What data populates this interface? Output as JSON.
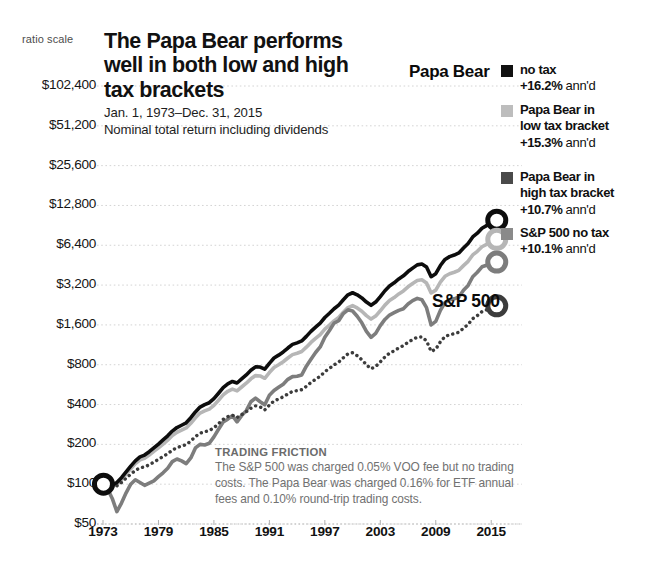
{
  "chart_data": {
    "type": "line",
    "title": "The Papa Bear performs well in both low and high tax brackets",
    "subtitle_line1": "Jan. 1, 1973–Dec. 31, 2015",
    "subtitle_line2": "Nominal total return including dividends",
    "scale_note": "ratio scale",
    "xlabel": "",
    "ylabel": "",
    "grid": true,
    "legend_position": "right",
    "y_scale": "log2",
    "ylim": [
      50,
      102400
    ],
    "xlim": [
      1973,
      2015.95
    ],
    "ytick_labels": [
      "$102,400",
      "$51,200",
      "$25,600",
      "$12,800",
      "$6,400",
      "$3,200",
      "$1,600",
      "$800",
      "$400",
      "$200",
      "$100",
      "$50"
    ],
    "ytick_values": [
      102400,
      51200,
      25600,
      12800,
      6400,
      3200,
      1600,
      800,
      400,
      200,
      100,
      50
    ],
    "xtick_labels": [
      "1973",
      "1979",
      "1985",
      "1991",
      "1997",
      "2003",
      "2009",
      "2015"
    ],
    "xtick_values": [
      1973,
      1979,
      1985,
      1991,
      1997,
      2003,
      2009,
      2015
    ],
    "inline_labels": [
      {
        "text": "Papa Bear",
        "series": "papa-bear-no-tax"
      },
      {
        "text": "S&P 500",
        "series": "sp500-no-tax"
      }
    ],
    "start_value": 100,
    "start_year": 1973,
    "series": [
      {
        "name": "no tax",
        "full_name": "Papa Bear no tax",
        "annualized": "+16.2%",
        "color": "#0d0d0d",
        "style": "solid",
        "width": 3.6,
        "end_value": 65000,
        "x": [
          1973.0,
          1973.5,
          1974.0,
          1974.5,
          1975.0,
          1975.5,
          1976.0,
          1976.5,
          1977.0,
          1977.5,
          1978.0,
          1978.5,
          1979.0,
          1979.5,
          1980.0,
          1980.5,
          1981.0,
          1981.5,
          1982.0,
          1982.5,
          1983.0,
          1983.5,
          1984.0,
          1984.5,
          1985.0,
          1985.5,
          1986.0,
          1986.5,
          1987.0,
          1987.5,
          1988.0,
          1988.5,
          1989.0,
          1989.5,
          1990.0,
          1990.5,
          1991.0,
          1991.5,
          1992.0,
          1992.5,
          1993.0,
          1993.5,
          1994.0,
          1994.5,
          1995.0,
          1995.5,
          1996.0,
          1996.5,
          1997.0,
          1997.5,
          1998.0,
          1998.5,
          1999.0,
          1999.5,
          2000.0,
          2000.5,
          2001.0,
          2001.5,
          2002.0,
          2002.5,
          2003.0,
          2003.5,
          2004.0,
          2004.5,
          2005.0,
          2005.5,
          2006.0,
          2006.5,
          2007.0,
          2007.5,
          2008.0,
          2008.5,
          2009.0,
          2009.5,
          2010.0,
          2010.5,
          2011.0,
          2011.5,
          2012.0,
          2012.5,
          2013.0,
          2013.5,
          2014.0,
          2014.5,
          2015.0,
          2015.5,
          2015.95
        ],
        "y": [
          100,
          104,
          98,
          103,
          112,
          124,
          137,
          150,
          161,
          166,
          176,
          188,
          201,
          216,
          232,
          252,
          268,
          279,
          291,
          318,
          352,
          383,
          400,
          413,
          443,
          487,
          537,
          574,
          598,
          582,
          625,
          670,
          726,
          770,
          768,
          740,
          820,
          900,
          945,
          1000,
          1070,
          1140,
          1170,
          1210,
          1310,
          1430,
          1540,
          1650,
          1820,
          1960,
          2120,
          2260,
          2480,
          2700,
          2800,
          2700,
          2560,
          2380,
          2250,
          2380,
          2620,
          2900,
          3150,
          3330,
          3560,
          3760,
          4050,
          4300,
          4550,
          4620,
          4380,
          3700,
          3900,
          4500,
          5000,
          5250,
          5400,
          5600,
          6100,
          6600,
          7400,
          7900,
          8600,
          9000,
          9600,
          9900,
          10200
        ]
      },
      {
        "name": "Papa Bear in low tax bracket",
        "full_name": "Papa Bear in low tax bracket",
        "annualized": "+15.3%",
        "color": "#b6b6b6",
        "style": "solid",
        "width": 3.6,
        "end_value": 55000,
        "x": [
          1973.0,
          1973.5,
          1974.0,
          1974.5,
          1975.0,
          1975.5,
          1976.0,
          1976.5,
          1977.0,
          1977.5,
          1978.0,
          1978.5,
          1979.0,
          1979.5,
          1980.0,
          1980.5,
          1981.0,
          1981.5,
          1982.0,
          1982.5,
          1983.0,
          1983.5,
          1984.0,
          1984.5,
          1985.0,
          1985.5,
          1986.0,
          1986.5,
          1987.0,
          1987.5,
          1988.0,
          1988.5,
          1989.0,
          1989.5,
          1990.0,
          1990.5,
          1991.0,
          1991.5,
          1992.0,
          1992.5,
          1993.0,
          1993.5,
          1994.0,
          1994.5,
          1995.0,
          1995.5,
          1996.0,
          1996.5,
          1997.0,
          1997.5,
          1998.0,
          1998.5,
          1999.0,
          1999.5,
          2000.0,
          2000.5,
          2001.0,
          2001.5,
          2002.0,
          2002.5,
          2003.0,
          2003.5,
          2004.0,
          2004.5,
          2005.0,
          2005.5,
          2006.0,
          2006.5,
          2007.0,
          2007.5,
          2008.0,
          2008.5,
          2009.0,
          2009.5,
          2010.0,
          2010.5,
          2011.0,
          2011.5,
          2012.0,
          2012.5,
          2013.0,
          2013.5,
          2014.0,
          2014.5,
          2015.0,
          2015.5,
          2015.95
        ],
        "y": [
          100,
          103,
          96,
          100,
          108,
          119,
          131,
          143,
          153,
          157,
          166,
          177,
          188,
          201,
          215,
          233,
          247,
          256,
          266,
          289,
          318,
          345,
          358,
          369,
          394,
          431,
          473,
          504,
          523,
          508,
          543,
          580,
          626,
          662,
          658,
          632,
          698,
          763,
          799,
          843,
          899,
          954,
          977,
          1008,
          1086,
          1180,
          1266,
          1352,
          1486,
          1594,
          1718,
          1824,
          1996,
          2164,
          2238,
          2150,
          2030,
          1880,
          1770,
          1866,
          2046,
          2258,
          2444,
          2576,
          2744,
          2890,
          3104,
          3286,
          3466,
          3510,
          3320,
          2790,
          2930,
          3370,
          3730,
          3900,
          4000,
          4140,
          4490,
          4840,
          5410,
          5760,
          6240,
          6500,
          6900,
          7100,
          7300
        ]
      },
      {
        "name": "Papa Bear in high tax bracket",
        "full_name": "Papa Bear in high tax bracket",
        "annualized": "+10.7%",
        "color": "#3c3c3c",
        "style": "dotted",
        "width": 3.4,
        "end_value": 9000,
        "x": [
          1973.0,
          1973.5,
          1974.0,
          1974.5,
          1975.0,
          1975.5,
          1976.0,
          1976.5,
          1977.0,
          1977.5,
          1978.0,
          1978.5,
          1979.0,
          1979.5,
          1980.0,
          1980.5,
          1981.0,
          1981.5,
          1982.0,
          1982.5,
          1983.0,
          1983.5,
          1984.0,
          1984.5,
          1985.0,
          1985.5,
          1986.0,
          1986.5,
          1987.0,
          1987.5,
          1988.0,
          1988.5,
          1989.0,
          1989.5,
          1990.0,
          1990.5,
          1991.0,
          1991.5,
          1992.0,
          1992.5,
          1993.0,
          1993.5,
          1994.0,
          1994.5,
          1995.0,
          1995.5,
          1996.0,
          1996.5,
          1997.0,
          1997.5,
          1998.0,
          1998.5,
          1999.0,
          1999.5,
          2000.0,
          2000.5,
          2001.0,
          2001.5,
          2002.0,
          2002.5,
          2003.0,
          2003.5,
          2004.0,
          2004.5,
          2005.0,
          2005.5,
          2006.0,
          2006.5,
          2007.0,
          2007.5,
          2008.0,
          2008.5,
          2009.0,
          2009.5,
          2010.0,
          2010.5,
          2011.0,
          2011.5,
          2012.0,
          2012.5,
          2013.0,
          2013.5,
          2014.0,
          2014.5,
          2015.0,
          2015.5,
          2015.95
        ],
        "y": [
          100,
          102,
          95,
          97,
          103,
          111,
          119,
          127,
          133,
          135,
          140,
          147,
          154,
          162,
          170,
          181,
          189,
          194,
          199,
          212,
          229,
          243,
          249,
          254,
          267,
          287,
          309,
          324,
          332,
          319,
          336,
          353,
          375,
          391,
          384,
          364,
          396,
          426,
          440,
          458,
          481,
          503,
          509,
          518,
          549,
          588,
          621,
          654,
          709,
          750,
          798,
          837,
          903,
          967,
          986,
          936,
          873,
          800,
          745,
          776,
          840,
          916,
          978,
          1019,
          1072,
          1115,
          1183,
          1238,
          1292,
          1296,
          1212,
          1008,
          1048,
          1192,
          1305,
          1350,
          1372,
          1407,
          1512,
          1613,
          1785,
          1882,
          2018,
          2080,
          2188,
          2232,
          2270
        ]
      },
      {
        "name": "S&P 500 no tax",
        "full_name": "S&P 500 no tax",
        "annualized": "+10.1%",
        "color": "#7d7d7d",
        "style": "solid",
        "width": 3.6,
        "end_value": 6400,
        "x": [
          1973.0,
          1973.5,
          1974.0,
          1974.5,
          1975.0,
          1975.5,
          1976.0,
          1976.5,
          1977.0,
          1977.5,
          1978.0,
          1978.5,
          1979.0,
          1979.5,
          1980.0,
          1980.5,
          1981.0,
          1981.5,
          1982.0,
          1982.5,
          1983.0,
          1983.5,
          1984.0,
          1984.5,
          1985.0,
          1985.5,
          1986.0,
          1986.5,
          1987.0,
          1987.5,
          1988.0,
          1988.5,
          1989.0,
          1989.5,
          1990.0,
          1990.5,
          1991.0,
          1991.5,
          1992.0,
          1992.5,
          1993.0,
          1993.5,
          1994.0,
          1994.5,
          1995.0,
          1995.5,
          1996.0,
          1996.5,
          1997.0,
          1997.5,
          1998.0,
          1998.5,
          1999.0,
          1999.5,
          2000.0,
          2000.5,
          2001.0,
          2001.5,
          2002.0,
          2002.5,
          2003.0,
          2003.5,
          2004.0,
          2004.5,
          2005.0,
          2005.5,
          2006.0,
          2006.5,
          2007.0,
          2007.5,
          2008.0,
          2008.5,
          2009.0,
          2009.5,
          2010.0,
          2010.5,
          2011.0,
          2011.5,
          2012.0,
          2012.5,
          2013.0,
          2013.5,
          2014.0,
          2014.5,
          2015.0,
          2015.5,
          2015.95
        ],
        "y": [
          100,
          92,
          78,
          62,
          72,
          86,
          100,
          108,
          103,
          98,
          102,
          106,
          114,
          122,
          132,
          148,
          155,
          150,
          143,
          158,
          188,
          200,
          198,
          204,
          228,
          260,
          295,
          310,
          330,
          296,
          330,
          360,
          420,
          448,
          420,
          398,
          470,
          510,
          540,
          570,
          620,
          650,
          655,
          670,
          780,
          880,
          990,
          1090,
          1290,
          1450,
          1650,
          1720,
          1950,
          2080,
          2040,
          1860,
          1660,
          1430,
          1290,
          1380,
          1580,
          1760,
          1900,
          1980,
          2060,
          2120,
          2300,
          2440,
          2540,
          2480,
          2160,
          1600,
          1700,
          2060,
          2360,
          2480,
          2520,
          2600,
          2920,
          3180,
          3700,
          4000,
          4400,
          4520,
          4720,
          4780,
          4860
        ]
      }
    ],
    "markers": [
      {
        "series": "no tax",
        "year": 2015.6,
        "value": 9900,
        "color": "#0d0d0d"
      },
      {
        "series": "Papa Bear in low tax bracket",
        "year": 2015.6,
        "value": 7100,
        "color": "#b6b6b6"
      },
      {
        "series": "Papa Bear in high tax bracket",
        "year": 2015.6,
        "value": 2232,
        "color": "#3c3c3c"
      },
      {
        "series": "S&P 500 no tax",
        "year": 2015.6,
        "value": 4780,
        "color": "#7d7d7d"
      },
      {
        "series": "start",
        "year": 1973.05,
        "value": 100,
        "color": "#0d0d0d"
      }
    ]
  },
  "legend": {
    "items": [
      {
        "color": "#111111",
        "line1": "no tax",
        "pct": "+16.2%",
        "ann": "ann'd",
        "line_mid": ""
      },
      {
        "color": "#bdbdbd",
        "line1": "Papa Bear in",
        "line_mid": "low tax bracket",
        "pct": "+15.3%",
        "ann": "ann'd"
      },
      {
        "color": "#4a4a4a",
        "line1": "Papa Bear in",
        "line_mid": "high tax bracket",
        "pct": "+10.7%",
        "ann": "ann'd"
      },
      {
        "color": "#8a8a8a",
        "line1": "S&P 500 no tax",
        "line_mid": "",
        "pct": "+10.1%",
        "ann": "ann'd"
      }
    ]
  },
  "note": {
    "title": "TRADING FRICTION",
    "body": "The S&P 500 was charged 0.05% VOO fee but no trading costs. The Papa Bear was charged 0.16% for ETF annual fees and 0.10% round-trip trading costs."
  }
}
